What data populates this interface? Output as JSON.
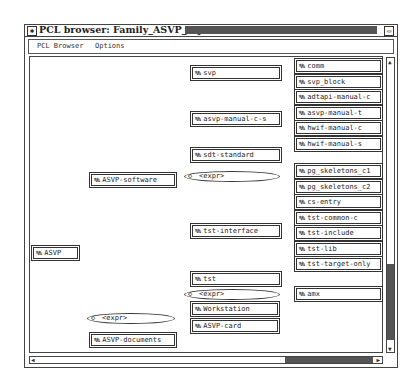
{
  "window": {
    "title": "PCL browser: Family_ASVP_top",
    "menu": [
      "PCL Browser",
      "Options"
    ]
  },
  "icons": {
    "node": "family-icon",
    "expr": "diamond-icon"
  },
  "tree": {
    "root": "ASVP",
    "level1": {
      "software": "ASVP-software",
      "expr": "<expr>",
      "documents": "ASVP-documents"
    },
    "expr1_children": [
      "Workstation",
      "ASVP-card"
    ],
    "software_children": {
      "svp": "svp",
      "asvp_manual_c_s": "asvp-manual-c-s",
      "sdt_standard": "sdt-standard",
      "expr_a": "<expr>",
      "tst_interface": "tst-interface",
      "tst": "tst",
      "expr_b": "<expr>"
    },
    "svp_children": [
      "comm",
      "svp_block"
    ],
    "asvp_manual_children": [
      "adtapi-manual-c",
      "asvp-manual-t",
      "hwif-manual-c",
      "hwif-manual-s"
    ],
    "expr_a_children": [
      "pg_skeletons_c1",
      "pg_skeletons_c2"
    ],
    "tst_interface_children": [
      "cs-entry",
      "tst-common-c",
      "tst-include",
      "tst-lib",
      "tst-target-only"
    ],
    "expr_b_children": [
      "amx"
    ]
  }
}
